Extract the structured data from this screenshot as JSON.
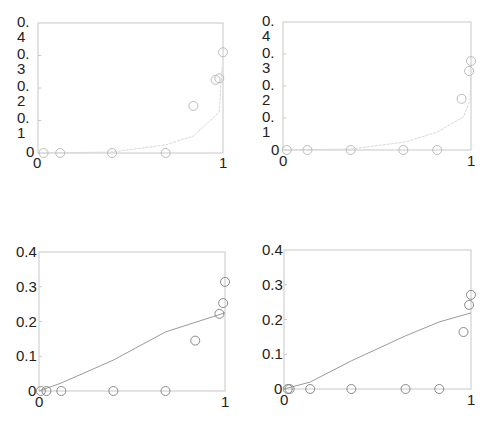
{
  "chart_data": [
    {
      "type": "scatter",
      "panel": "top-left",
      "title": "",
      "xlabel": "",
      "ylabel": "",
      "xlim": [
        0,
        1
      ],
      "ylim": [
        0,
        0.4
      ],
      "grid": false,
      "x_ticks": [
        "0",
        "1"
      ],
      "y_ticks": [
        "0",
        "0.1",
        "0.2",
        "0.3",
        "0.4"
      ],
      "y_tick_display": [
        "0",
        "0.\n1",
        "0.\n2",
        "0.\n3",
        "0.\n4"
      ],
      "series": [
        {
          "name": "observed",
          "style": "circles",
          "x": [
            0.03,
            0.12,
            0.4,
            0.69,
            0.84,
            0.96,
            0.98,
            1.0
          ],
          "y": [
            0.0,
            0.0,
            0.0,
            0.0,
            0.145,
            0.225,
            0.23,
            0.31
          ]
        },
        {
          "name": "fit",
          "style": "line",
          "x": [
            0.0,
            0.4,
            0.69,
            0.84,
            0.98,
            0.995
          ],
          "y": [
            0.0,
            0.003,
            0.025,
            0.052,
            0.126,
            0.265
          ]
        }
      ]
    },
    {
      "type": "scatter",
      "panel": "top-right",
      "title": "",
      "xlabel": "",
      "ylabel": "",
      "xlim": [
        0,
        1
      ],
      "ylim": [
        0,
        0.4
      ],
      "grid": false,
      "x_ticks": [
        "0",
        "1"
      ],
      "y_ticks": [
        "0",
        "0.1",
        "0.2",
        "0.3",
        "0.4"
      ],
      "y_tick_display": [
        "0",
        "0.\n1",
        "0.\n2",
        "0.\n3",
        "0.\n4"
      ],
      "series": [
        {
          "name": "observed",
          "style": "circles",
          "x": [
            0.02,
            0.13,
            0.36,
            0.64,
            0.82,
            0.95,
            0.99,
            1.0
          ],
          "y": [
            0.0,
            0.0,
            0.0,
            0.0,
            0.0,
            0.16,
            0.247,
            0.278
          ]
        },
        {
          "name": "fit",
          "style": "line",
          "x": [
            0.0,
            0.36,
            0.65,
            0.82,
            0.96,
            0.995,
            1.0
          ],
          "y": [
            0.0,
            0.003,
            0.025,
            0.056,
            0.103,
            0.156,
            0.234
          ]
        }
      ]
    },
    {
      "type": "scatter",
      "panel": "bottom-left",
      "title": "",
      "xlabel": "",
      "ylabel": "",
      "xlim": [
        0,
        1
      ],
      "ylim": [
        0,
        0.4
      ],
      "grid": false,
      "x_ticks": [
        "0",
        "1"
      ],
      "y_ticks": [
        "0",
        "0.1",
        "0.2",
        "0.3",
        "0.4"
      ],
      "y_tick_display": [
        "0",
        "0.1",
        "0.2",
        "0.3",
        "0.4"
      ],
      "series": [
        {
          "name": "observed",
          "style": "circles",
          "x": [
            0.01,
            0.04,
            0.12,
            0.4,
            0.68,
            0.84,
            0.97,
            0.99,
            1.0
          ],
          "y": [
            0.0,
            0.0,
            0.0,
            0.0,
            0.0,
            0.145,
            0.222,
            0.253,
            0.314
          ]
        },
        {
          "name": "fit",
          "style": "line",
          "x": [
            0.0,
            0.12,
            0.4,
            0.68,
            1.0
          ],
          "y": [
            0.0,
            0.023,
            0.089,
            0.17,
            0.225
          ]
        }
      ]
    },
    {
      "type": "scatter",
      "panel": "bottom-right",
      "title": "",
      "xlabel": "",
      "ylabel": "",
      "xlim": [
        0,
        1
      ],
      "ylim": [
        0,
        0.4
      ],
      "grid": false,
      "x_ticks": [
        "0",
        "1"
      ],
      "y_ticks": [
        "0",
        "0.1",
        "0.2",
        "0.3",
        "0.4"
      ],
      "y_tick_display": [
        "0",
        "0.1",
        "0.2",
        "0.3",
        "0.4"
      ],
      "series": [
        {
          "name": "observed",
          "style": "circles",
          "x": [
            0.02,
            0.03,
            0.14,
            0.36,
            0.65,
            0.83,
            0.96,
            0.99,
            1.0
          ],
          "y": [
            0.0,
            0.0,
            0.0,
            0.0,
            0.0,
            0.0,
            0.164,
            0.242,
            0.271
          ]
        },
        {
          "name": "fit",
          "style": "line",
          "x": [
            0.0,
            0.14,
            0.36,
            0.65,
            0.83,
            1.0
          ],
          "y": [
            0.0,
            0.02,
            0.081,
            0.153,
            0.193,
            0.219
          ]
        }
      ]
    }
  ],
  "colors": {
    "axes": "#c8c8c8",
    "text": "#222222",
    "line_top": "#d8d8d8",
    "circle_top": "#bbbbbb",
    "line_bottom": "#9a9a9a",
    "circle_bottom": "#8a8a8a"
  }
}
